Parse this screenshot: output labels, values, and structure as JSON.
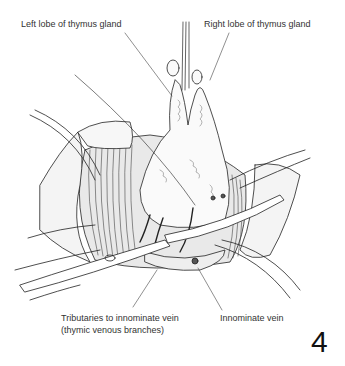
{
  "figure": {
    "number": "4",
    "labels": {
      "left_lobe": "Left lobe of thymus gland",
      "right_lobe": "Right lobe of thymus gland",
      "tributaries_line1": "Tributaries to innominate vein",
      "tributaries_line2": "(thymic venous branches)",
      "innominate_vein": "Innominate vein"
    }
  }
}
